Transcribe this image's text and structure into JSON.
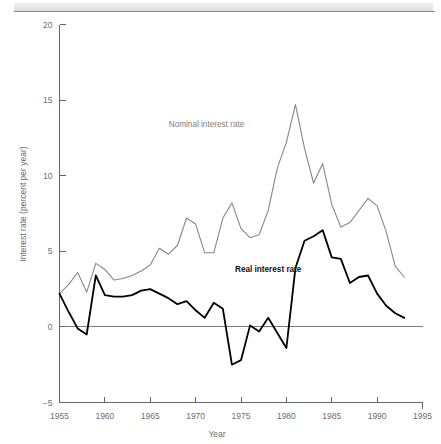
{
  "figure": {
    "header_band_name": "page-header-rule"
  },
  "chart_data": {
    "type": "line",
    "title": "",
    "xlabel": "Year",
    "ylabel": "Interest rate (percent per year)",
    "xlim": [
      1955,
      1995
    ],
    "ylim": [
      -5,
      20
    ],
    "xticks": [
      1955,
      1960,
      1965,
      1970,
      1975,
      1980,
      1985,
      1990,
      1995
    ],
    "xtick_labels": [
      "1955",
      "1960",
      "1965",
      "1970",
      "1975",
      "1980",
      "1985",
      "1990",
      "1995"
    ],
    "yticks": [
      -5,
      0,
      5,
      10,
      15,
      20
    ],
    "ytick_labels": [
      "-5",
      "0",
      "5",
      "10",
      "15",
      "20"
    ],
    "grid": false,
    "legend_position": "inline-annotations",
    "zero_line": 0,
    "annotations": [
      {
        "text": "Nominal interest rate",
        "x": 1971.2,
        "y": 13.2,
        "color": "#808080",
        "bold": false
      },
      {
        "text": "Real interest rate",
        "x": 1978.0,
        "y": 3.6,
        "color": "#111111",
        "bold": true
      }
    ],
    "x": [
      1955,
      1956,
      1957,
      1958,
      1959,
      1960,
      1961,
      1962,
      1963,
      1964,
      1965,
      1966,
      1967,
      1968,
      1969,
      1970,
      1971,
      1972,
      1973,
      1974,
      1975,
      1976,
      1977,
      1978,
      1979,
      1980,
      1981,
      1982,
      1983,
      1984,
      1985,
      1986,
      1987,
      1988,
      1989,
      1990,
      1991,
      1992,
      1993
    ],
    "series": [
      {
        "name": "Nominal interest rate",
        "color": "#878787",
        "values": [
          2.2,
          2.8,
          3.6,
          2.3,
          4.2,
          3.8,
          3.1,
          3.2,
          3.4,
          3.7,
          4.1,
          5.2,
          4.8,
          5.4,
          7.2,
          6.8,
          4.9,
          4.9,
          7.2,
          8.2,
          6.5,
          5.9,
          6.1,
          7.7,
          10.5,
          12.2,
          14.7,
          11.8,
          9.5,
          10.8,
          8.1,
          6.6,
          6.9,
          7.7,
          8.5,
          8.0,
          6.3,
          4.0,
          3.3
        ]
      },
      {
        "name": "Real interest rate",
        "color": "#000000",
        "values": [
          2.2,
          1.0,
          -0.1,
          -0.5,
          3.4,
          2.1,
          2.0,
          2.0,
          2.1,
          2.4,
          2.5,
          2.2,
          1.9,
          1.5,
          1.7,
          1.1,
          0.6,
          1.6,
          1.2,
          -2.5,
          -2.2,
          0.1,
          -0.3,
          0.6,
          -0.4,
          -1.4,
          3.9,
          5.7,
          6.0,
          6.4,
          4.6,
          4.5,
          2.9,
          3.3,
          3.4,
          2.2,
          1.4,
          0.9,
          0.6
        ]
      }
    ]
  }
}
